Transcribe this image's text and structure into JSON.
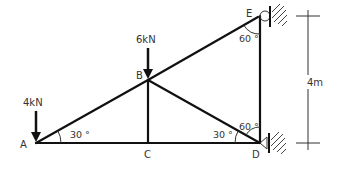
{
  "diagram": {
    "type": "truss",
    "nodes": {
      "A": {
        "label": "A",
        "x": 36,
        "y": 143
      },
      "B": {
        "label": "B",
        "x": 148,
        "y": 80
      },
      "C": {
        "label": "C",
        "x": 148,
        "y": 143
      },
      "D": {
        "label": "D",
        "x": 260,
        "y": 143
      },
      "E": {
        "label": "E",
        "x": 260,
        "y": 16
      }
    },
    "members": [
      "A-B",
      "B-E",
      "A-C",
      "C-D",
      "B-C",
      "B-D",
      "D-E"
    ],
    "loads": [
      {
        "node": "A",
        "label": "4kN"
      },
      {
        "node": "B",
        "label": "6kN"
      }
    ],
    "angles": [
      {
        "at": "A",
        "label": "30 °"
      },
      {
        "at": "D-left",
        "label": "30 °"
      },
      {
        "at": "D-top",
        "label": "60 °"
      },
      {
        "at": "E",
        "label": "60 °"
      }
    ],
    "supports": [
      {
        "node": "E",
        "type": "pin-wall"
      },
      {
        "node": "D",
        "type": "pin-wall"
      }
    ],
    "dimension": {
      "label": "4m",
      "from": "E",
      "to": "D"
    }
  }
}
